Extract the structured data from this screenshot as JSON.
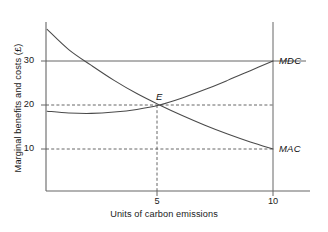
{
  "chart_data": {
    "type": "line",
    "title": "",
    "xlabel": "Units of carbon emissions",
    "ylabel": "Marginal benefits and costs (£)",
    "xlim": [
      0,
      11.2
    ],
    "ylim": [
      0,
      38.5
    ],
    "xticks": [
      {
        "value": 5,
        "label": "5"
      },
      {
        "value": 10,
        "label": "10"
      }
    ],
    "yticks": [
      {
        "value": 10,
        "label": "10"
      },
      {
        "value": 20,
        "label": "20"
      },
      {
        "value": 30,
        "label": "30"
      }
    ],
    "grid": false,
    "legend_position": "right-of-axis-inline",
    "series": [
      {
        "name": "MAC",
        "label": "MAC",
        "style": "solid",
        "description": "Marginal abatement cost, downward sloping convex curve",
        "points": [
          {
            "x": 0.05,
            "y": 37.2
          },
          {
            "x": 1.0,
            "y": 32.6
          },
          {
            "x": 2.0,
            "y": 29.0
          },
          {
            "x": 3.0,
            "y": 25.6
          },
          {
            "x": 4.0,
            "y": 22.6
          },
          {
            "x": 5.0,
            "y": 20.0
          },
          {
            "x": 6.0,
            "y": 17.6
          },
          {
            "x": 7.0,
            "y": 15.4
          },
          {
            "x": 8.0,
            "y": 13.4
          },
          {
            "x": 9.0,
            "y": 11.6
          },
          {
            "x": 10.0,
            "y": 10.0
          }
        ]
      },
      {
        "name": "MDC",
        "label": "MDC",
        "style": "solid",
        "description": "Marginal damage cost, flat then upward sloping curve",
        "points": [
          {
            "x": 0.05,
            "y": 18.6
          },
          {
            "x": 1.0,
            "y": 18.2
          },
          {
            "x": 2.0,
            "y": 18.1
          },
          {
            "x": 3.0,
            "y": 18.4
          },
          {
            "x": 4.0,
            "y": 19.0
          },
          {
            "x": 5.0,
            "y": 20.0
          },
          {
            "x": 6.0,
            "y": 21.6
          },
          {
            "x": 7.0,
            "y": 23.5
          },
          {
            "x": 8.0,
            "y": 25.6
          },
          {
            "x": 9.0,
            "y": 27.8
          },
          {
            "x": 10.0,
            "y": 30.0
          }
        ]
      }
    ],
    "reference_lines": [
      {
        "name": "level-30",
        "orientation": "horizontal",
        "value": 30,
        "style": "solid",
        "from_x": 0,
        "to_x": 11.2
      },
      {
        "name": "level-20",
        "orientation": "horizontal",
        "value": 20,
        "style": "dashed",
        "from_x": 0,
        "to_x": 10
      },
      {
        "name": "level-10",
        "orientation": "horizontal",
        "value": 10,
        "style": "dashed",
        "from_x": 0,
        "to_x": 10
      },
      {
        "name": "quantity-5",
        "orientation": "vertical",
        "value": 5,
        "style": "dashed",
        "from_y": 0,
        "to_y": 20
      },
      {
        "name": "quantity-10",
        "orientation": "vertical",
        "value": 10,
        "style": "solid",
        "from_y": 0,
        "to_y": 38.5
      }
    ],
    "annotations": [
      {
        "name": "equilibrium-point",
        "label": "E",
        "x": 5,
        "y": 20,
        "note": "Intersection of MAC and MDC"
      },
      {
        "name": "mdc-curve-label",
        "label": "MDC",
        "x": 10.3,
        "y": 30
      },
      {
        "name": "mac-curve-label",
        "label": "MAC",
        "x": 10.3,
        "y": 10
      }
    ]
  },
  "axes": {
    "x_title": "Units of carbon emissions",
    "y_title": "Marginal benefits and costs (£)",
    "x_tick_labels": [
      "5",
      "10"
    ],
    "y_tick_labels": [
      "30",
      "20",
      "10"
    ]
  },
  "labels": {
    "mdc": "MDC",
    "mac": "MAC",
    "equilibrium": "E"
  },
  "colors": {
    "axis": "#555555",
    "curve": "#4a4a4a",
    "dashed": "#555555",
    "text": "#1a1a1a",
    "background": "#ffffff"
  }
}
